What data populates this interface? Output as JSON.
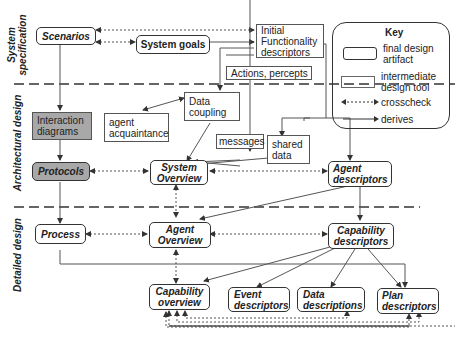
{
  "phases": {
    "system_spec": [
      "System",
      "specification"
    ],
    "architectural": "Architectural design",
    "detailed": "Detailed design"
  },
  "nodes": {
    "scenarios": "Scenarios",
    "system_goals": "System goals",
    "initial_functionality": [
      "Initial",
      "Functionality",
      "descriptors"
    ],
    "actions_percepts": "Actions, percepts",
    "interaction_diagrams": [
      "Interaction",
      "diagrams"
    ],
    "agent_acquaintance": [
      "agent",
      "acquaintance"
    ],
    "data_coupling": [
      "Data",
      "coupling"
    ],
    "messages": "messages",
    "shared_data": [
      "shared",
      "data"
    ],
    "protocols": "Protocols",
    "system_overview": [
      "System",
      "Overview"
    ],
    "agent_descriptors": [
      "Agent",
      "descriptors"
    ],
    "process": "Process",
    "agent_overview": [
      "Agent",
      "Overview"
    ],
    "capability_descriptors": [
      "Capability",
      "descriptors"
    ],
    "capability_overview": [
      "Capability",
      "overview"
    ],
    "event_descriptors": [
      "Event",
      "descriptors"
    ],
    "data_descriptions": [
      "Data",
      "descriptions"
    ],
    "plan_descriptors": [
      "Plan",
      "descriptors"
    ]
  },
  "key": {
    "title": "Key",
    "final": [
      "final design",
      "artifact"
    ],
    "intermediate": [
      "intermediate",
      "design tool"
    ],
    "crosscheck": "crosscheck",
    "derives": "derives"
  },
  "colors": {
    "line": "#444444",
    "shaded": "#a8a8a8",
    "border": "#333333"
  }
}
